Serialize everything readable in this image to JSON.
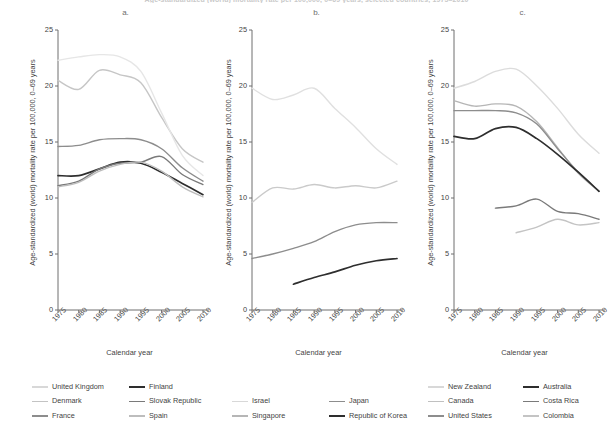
{
  "figure": {
    "title": "Age-standardized (world) mortality rate per 100,000, 0–69 years, selected countries, 1975–2010",
    "ylabel": "Age-standardized (world) mortality rate per 100,000, 0–69 years",
    "xlabel": "Calendar year"
  },
  "panels": [
    {
      "label": "a."
    },
    {
      "label": "b."
    },
    {
      "label": "c."
    }
  ],
  "axis": {
    "yticks": [
      "0",
      "5",
      "10",
      "15",
      "20",
      "25"
    ],
    "xticks": [
      "1975",
      "1980",
      "1985",
      "1990",
      "1995",
      "2000",
      "2005",
      "2010"
    ],
    "ylim": [
      0,
      25
    ],
    "xlim": [
      1975,
      2010
    ]
  },
  "colors": {
    "lightest": "#e3e3e3",
    "light": "#cfcfcf",
    "mid_light": "#b0b0b0",
    "mid": "#8d8d8d",
    "mid_dark": "#777777",
    "dark": "#2e2e2e",
    "axis": "#6f6f6f"
  },
  "chart_data": [
    {
      "type": "line",
      "panel": "a.",
      "title": "",
      "xlabel": "Calendar year",
      "ylabel": "Age-standardized (world) mortality rate per 100,000, 0–69 years",
      "xlim": [
        1975,
        2010
      ],
      "ylim": [
        0,
        25
      ],
      "grid": false,
      "legend_position": "below",
      "x": [
        1975,
        1980,
        1985,
        1990,
        1995,
        2000,
        2005,
        2010
      ],
      "series": [
        {
          "name": "United Kingdom",
          "color": "#c6c6c6",
          "values": [
            20.5,
            19.7,
            21.4,
            21.0,
            20.3,
            17.2,
            14.4,
            13.2
          ]
        },
        {
          "name": "Denmark",
          "color": "#e6e6e6",
          "values": [
            22.3,
            22.6,
            22.8,
            22.6,
            21.3,
            17.6,
            13.8,
            12.0
          ]
        },
        {
          "name": "France",
          "color": "#8d8d8d",
          "values": [
            14.6,
            14.7,
            15.2,
            15.3,
            15.2,
            14.4,
            12.7,
            11.5
          ]
        },
        {
          "name": "Finland",
          "color": "#2e2e2e",
          "values": [
            12.0,
            12.0,
            12.6,
            13.2,
            13.1,
            12.3,
            11.3,
            10.3
          ]
        },
        {
          "name": "Slovak Republic",
          "color": "#7a7a7a",
          "values": [
            11.1,
            11.5,
            12.6,
            13.1,
            13.2,
            13.7,
            12.1,
            11.2
          ]
        },
        {
          "name": "Spain",
          "color": "#bdbdbd",
          "values": [
            11.0,
            11.4,
            12.4,
            13.0,
            13.2,
            12.4,
            11.0,
            10.1
          ]
        }
      ]
    },
    {
      "type": "line",
      "panel": "b.",
      "title": "",
      "xlabel": "Calendar year",
      "ylabel": "Age-standardized (world) mortality rate per 100,000, 0–69 years",
      "xlim": [
        1975,
        2010
      ],
      "ylim": [
        0,
        25
      ],
      "grid": false,
      "legend_position": "below",
      "x": [
        1975,
        1980,
        1985,
        1990,
        1995,
        2000,
        2005,
        2010
      ],
      "series": [
        {
          "name": "Israel",
          "color": "#e0e0e0",
          "values": [
            19.8,
            18.8,
            19.2,
            19.8,
            18.0,
            16.3,
            14.4,
            13.0
          ]
        },
        {
          "name": "Singapore",
          "color": "#cacaca",
          "values": [
            9.6,
            10.9,
            10.8,
            11.2,
            10.9,
            11.1,
            10.9,
            11.5
          ]
        },
        {
          "name": "Japan",
          "color": "#8d8d8d",
          "values": [
            4.6,
            5.0,
            5.5,
            6.1,
            7.0,
            7.6,
            7.8,
            7.8
          ]
        },
        {
          "name": "Republic of Korea",
          "color": "#2e2e2e",
          "values": [
            null,
            null,
            2.3,
            2.9,
            3.4,
            4.0,
            4.4,
            4.6
          ]
        }
      ]
    },
    {
      "type": "line",
      "panel": "c.",
      "title": "",
      "xlabel": "Calendar year",
      "ylabel": "Age-standardized (world) mortality rate per 100,000, 0–69 years",
      "xlim": [
        1975,
        2010
      ],
      "ylim": [
        0,
        25
      ],
      "grid": false,
      "legend_position": "below",
      "x": [
        1975,
        1980,
        1985,
        1990,
        1995,
        2000,
        2005,
        2010
      ],
      "series": [
        {
          "name": "New Zealand",
          "color": "#dcdcdc",
          "values": [
            19.8,
            20.4,
            21.3,
            21.5,
            20.0,
            18.0,
            15.7,
            14.0
          ]
        },
        {
          "name": "Canada",
          "color": "#b6b6b6",
          "values": [
            18.7,
            18.2,
            18.4,
            18.2,
            16.8,
            14.5,
            12.2,
            10.6
          ]
        },
        {
          "name": "United States",
          "color": "#8d8d8d",
          "values": [
            17.8,
            17.8,
            17.8,
            17.6,
            16.6,
            14.4,
            12.3,
            10.6
          ]
        },
        {
          "name": "Australia",
          "color": "#2e2e2e",
          "values": [
            15.5,
            15.3,
            16.2,
            16.3,
            15.3,
            13.9,
            12.3,
            10.6
          ]
        },
        {
          "name": "Costa Rica",
          "color": "#7a7a7a",
          "values": [
            null,
            null,
            9.1,
            9.3,
            9.9,
            8.8,
            8.6,
            8.1
          ]
        },
        {
          "name": "Colombia",
          "color": "#c4c4c4",
          "values": [
            null,
            null,
            null,
            6.9,
            7.4,
            8.1,
            7.6,
            7.8
          ]
        }
      ]
    }
  ],
  "legends": [
    {
      "panel": "a.",
      "items": [
        {
          "label": "United Kingdom",
          "color": "#d8d8d8"
        },
        {
          "label": "Denmark",
          "color": "#c3c3c3"
        },
        {
          "label": "France",
          "color": "#8d8d8d"
        },
        {
          "label": "Finland",
          "color": "#2e2e2e"
        },
        {
          "label": "Slovak Republic",
          "color": "#7a7a7a"
        },
        {
          "label": "Spain",
          "color": "#bdbdbd"
        }
      ]
    },
    {
      "panel": "b.",
      "items": [
        {
          "label": "Israel",
          "color": "#d8d8d8"
        },
        {
          "label": "Singapore",
          "color": "#b6b6b6"
        },
        {
          "label": "Japan",
          "color": "#8d8d8d"
        },
        {
          "label": "Republic of Korea",
          "color": "#2e2e2e"
        }
      ]
    },
    {
      "panel": "c.",
      "items": [
        {
          "label": "New Zealand",
          "color": "#d8d8d8"
        },
        {
          "label": "Canada",
          "color": "#c0c0c0"
        },
        {
          "label": "United States",
          "color": "#8d8d8d"
        },
        {
          "label": "Australia",
          "color": "#2e2e2e"
        },
        {
          "label": "Costa Rica",
          "color": "#7a7a7a"
        },
        {
          "label": "Colombia",
          "color": "#c4c4c4"
        }
      ]
    }
  ]
}
